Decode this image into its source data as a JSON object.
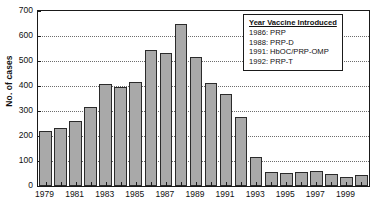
{
  "chart_data": {
    "type": "bar",
    "title": "",
    "xlabel": "",
    "ylabel": "No. of cases",
    "ylim": [
      0,
      700
    ],
    "ytick_values": [
      0,
      100,
      200,
      300,
      400,
      500,
      600,
      700
    ],
    "ytick_labels": [
      "0",
      "100",
      "200",
      "300",
      "400",
      "500",
      "600",
      "700"
    ],
    "grid": true,
    "grid_axis": "y",
    "legend_position": "upper right",
    "categories": [
      "1979",
      "1980",
      "1981",
      "1982",
      "1983",
      "1984",
      "1985",
      "1986",
      "1987",
      "1988",
      "1989",
      "1990",
      "1991",
      "1992",
      "1993",
      "1994",
      "1995",
      "1996",
      "1997",
      "1998",
      "1999",
      "2000"
    ],
    "xtick_labels": [
      "1979",
      "1981",
      "1983",
      "1985",
      "1987",
      "1989",
      "1991",
      "1993",
      "1995",
      "1997",
      "1999"
    ],
    "values": [
      220,
      233,
      260,
      315,
      409,
      398,
      418,
      545,
      531,
      648,
      517,
      412,
      367,
      277,
      116,
      58,
      51,
      55,
      61,
      47,
      37,
      44
    ],
    "bar_color": "#a9a9a9",
    "bar_edge_color": "#2b2b2b"
  },
  "legend": {
    "title": "Year Vaccine Introduced",
    "entries": [
      "1986: PRP",
      "1988: PRP-D",
      "1991: HbOC/PRP-OMP",
      "1992: PRP-T"
    ]
  },
  "caption": {
    "text": ""
  }
}
